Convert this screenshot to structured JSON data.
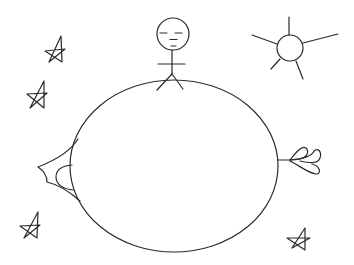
{
  "scene": {
    "title": "Hand-drawn doodle: stick figure standing on an egg-shaped planet with sun and stars",
    "background": "#ffffff",
    "ink_color": "#2a2a2a",
    "elements": [
      {
        "name": "planet",
        "type": "ellipse",
        "cx": 174,
        "cy": 166,
        "rx": 104,
        "ry": 86
      },
      {
        "name": "stick-figure",
        "type": "figure",
        "head": {
          "cx": 173,
          "cy": 34,
          "r": 16
        },
        "expression": "sleepy"
      },
      {
        "name": "sun",
        "type": "circle",
        "cx": 290,
        "cy": 48,
        "r": 13,
        "rays": 5
      },
      {
        "name": "star",
        "count": 4
      },
      {
        "name": "left-fin",
        "type": "fin"
      },
      {
        "name": "right-flower",
        "type": "petals",
        "petals": 3
      }
    ]
  }
}
